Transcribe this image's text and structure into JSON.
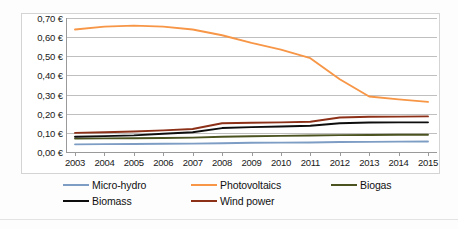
{
  "chart_data": {
    "type": "line",
    "title": "",
    "subtitle": "",
    "xlabel": "",
    "ylabel": "",
    "categories": [
      "2003",
      "2004",
      "2005",
      "2006",
      "2007",
      "2008",
      "2009",
      "2010",
      "2011",
      "2012",
      "2013",
      "2014",
      "2015"
    ],
    "x": [
      2003,
      2004,
      2005,
      2006,
      2007,
      2008,
      2009,
      2010,
      2011,
      2012,
      2013,
      2014,
      2015
    ],
    "ylim": [
      0.0,
      0.7
    ],
    "ytick_values": [
      0.0,
      0.1,
      0.2,
      0.3,
      0.4,
      0.5,
      0.6,
      0.7
    ],
    "ytick_labels": [
      "0,00 €",
      "0,10 €",
      "0,20 €",
      "0,30 €",
      "0,40 €",
      "0,50 €",
      "0,60 €",
      "0,70 €"
    ],
    "currency_symbol": "€",
    "decimal_separator": ",",
    "grid": "horizontal",
    "legend_position": "bottom",
    "series": [
      {
        "name": "Micro-hydro",
        "color": "#7e9dc4",
        "values": [
          0.04,
          0.041,
          0.042,
          0.043,
          0.044,
          0.046,
          0.048,
          0.049,
          0.05,
          0.052,
          0.053,
          0.054,
          0.055
        ]
      },
      {
        "name": "Photovoltaics",
        "color": "#f79646",
        "values": [
          0.64,
          0.655,
          0.66,
          0.655,
          0.64,
          0.61,
          0.57,
          0.535,
          0.49,
          0.38,
          0.29,
          0.275,
          0.262
        ]
      },
      {
        "name": "Biogas",
        "color": "#4b5320",
        "values": [
          0.07,
          0.071,
          0.072,
          0.073,
          0.075,
          0.08,
          0.082,
          0.084,
          0.086,
          0.088,
          0.089,
          0.09,
          0.09
        ]
      },
      {
        "name": "Biomass",
        "color": "#0d0d0d",
        "values": [
          0.08,
          0.083,
          0.087,
          0.095,
          0.103,
          0.125,
          0.13,
          0.133,
          0.137,
          0.15,
          0.154,
          0.155,
          0.155
        ]
      },
      {
        "name": "Wind power",
        "color": "#8c3018",
        "values": [
          0.1,
          0.103,
          0.107,
          0.113,
          0.12,
          0.15,
          0.153,
          0.155,
          0.158,
          0.18,
          0.184,
          0.185,
          0.186
        ]
      }
    ]
  },
  "legend": {
    "items": [
      {
        "label": "Micro-hydro",
        "color": "#7e9dc4",
        "row": 0,
        "col": 0
      },
      {
        "label": "Photovoltaics",
        "color": "#f79646",
        "row": 0,
        "col": 1
      },
      {
        "label": "Biogas",
        "color": "#4b5320",
        "row": 0,
        "col": 2
      },
      {
        "label": "Biomass",
        "color": "#0d0d0d",
        "row": 1,
        "col": 0
      },
      {
        "label": "Wind power",
        "color": "#8c3018",
        "row": 1,
        "col": 1
      }
    ]
  }
}
